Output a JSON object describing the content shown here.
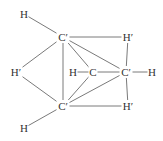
{
  "diagram": {
    "type": "molecular-structure",
    "atoms": [
      {
        "id": "H1",
        "label": "H",
        "x": 24,
        "y": 14
      },
      {
        "id": "C1",
        "label": "C′",
        "x": 63,
        "y": 37
      },
      {
        "id": "Hp1",
        "label": "H′",
        "x": 128,
        "y": 37
      },
      {
        "id": "Hp2",
        "label": "H′",
        "x": 16,
        "y": 72
      },
      {
        "id": "H2",
        "label": "H",
        "x": 73,
        "y": 72
      },
      {
        "id": "C2",
        "label": "C",
        "x": 93,
        "y": 72
      },
      {
        "id": "C3",
        "label": "C′",
        "x": 126,
        "y": 72
      },
      {
        "id": "H3",
        "label": "H",
        "x": 152,
        "y": 72
      },
      {
        "id": "C4",
        "label": "C′",
        "x": 63,
        "y": 106
      },
      {
        "id": "Hp3",
        "label": "H′",
        "x": 128,
        "y": 106
      },
      {
        "id": "H4",
        "label": "H",
        "x": 24,
        "y": 128
      }
    ],
    "bonds": [
      [
        "H1",
        "C1"
      ],
      [
        "C1",
        "Hp1"
      ],
      [
        "C1",
        "Hp2"
      ],
      [
        "C1",
        "C2"
      ],
      [
        "C1",
        "C3"
      ],
      [
        "C1",
        "C4"
      ],
      [
        "Hp1",
        "C3"
      ],
      [
        "H2",
        "C2"
      ],
      [
        "C2",
        "C3"
      ],
      [
        "C3",
        "H3"
      ],
      [
        "C3",
        "Hp3"
      ],
      [
        "C2",
        "C4"
      ],
      [
        "C3",
        "C4"
      ],
      [
        "Hp2",
        "C4"
      ],
      [
        "C4",
        "Hp3"
      ],
      [
        "C4",
        "H4"
      ]
    ],
    "colors": {
      "line": "#7a7a7a",
      "text": "#333333",
      "background": "#ffffff"
    }
  }
}
